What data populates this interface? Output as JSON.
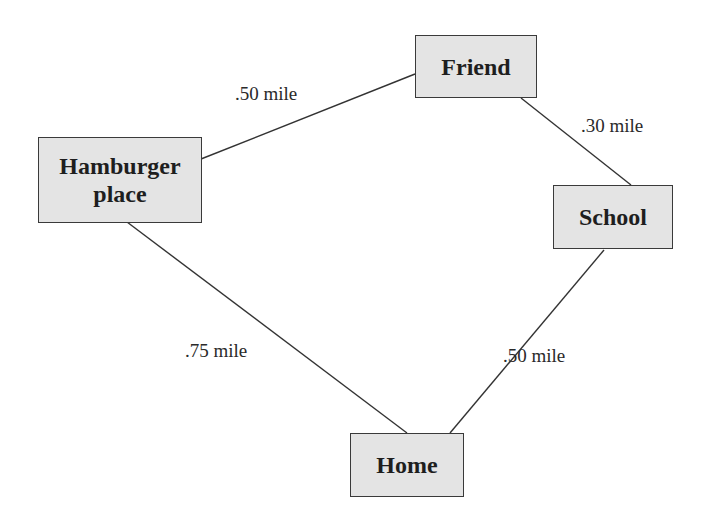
{
  "diagram": {
    "type": "distance-network",
    "nodes": [
      {
        "id": "friend",
        "label": "Friend"
      },
      {
        "id": "hamburger",
        "label_line1": "Hamburger",
        "label_line2": "place"
      },
      {
        "id": "school",
        "label": "School"
      },
      {
        "id": "home",
        "label": "Home"
      }
    ],
    "edges": [
      {
        "from": "hamburger",
        "to": "friend",
        "label": ".50 mile"
      },
      {
        "from": "friend",
        "to": "school",
        "label": ".30 mile"
      },
      {
        "from": "hamburger",
        "to": "home",
        "label": ".75 mile"
      },
      {
        "from": "school",
        "to": "home",
        "label": ".50 mile"
      }
    ],
    "colors": {
      "node_fill": "#e4e4e4",
      "node_border": "#3a3a3a",
      "line": "#333333",
      "text": "#1e1e1e"
    }
  }
}
